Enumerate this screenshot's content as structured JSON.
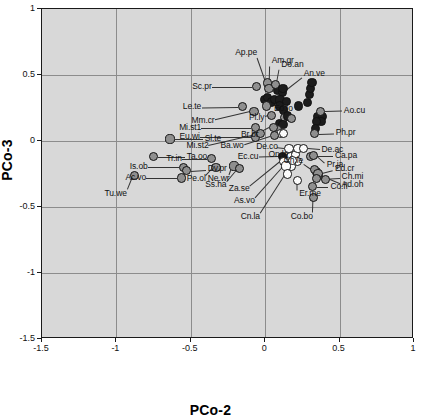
{
  "chart_data": {
    "type": "scatter",
    "title": "",
    "xlabel": "PCo-2",
    "ylabel": "PCo-3",
    "xlim": [
      -1.5,
      1.0
    ],
    "ylim": [
      -1.5,
      1.0
    ],
    "xticks": [
      "-1.5",
      "-1",
      "-0.5",
      "0",
      "0.5",
      "1"
    ],
    "xtick_values": [
      -1.5,
      -1,
      -0.5,
      0,
      0.5,
      1
    ],
    "yticks": [
      "1",
      "0.5",
      "0",
      "-0.5",
      "-1",
      "-1.5"
    ],
    "ytick_values": [
      1,
      0.5,
      0,
      -0.5,
      -1,
      -1.5
    ],
    "grid": true,
    "legend": "none",
    "plot_background": "#d8d8d8",
    "marker_groups": [
      {
        "name": "dark",
        "color": "#1c1c1c"
      },
      {
        "name": "gray",
        "color": "#8f8f8f"
      },
      {
        "name": "white",
        "color": "#fbfbfb"
      }
    ],
    "points": [
      {
        "label": "Sl.te",
        "x": -0.64,
        "y": 0.015,
        "group": "gray",
        "lx": -0.42,
        "ly": 0.015
      },
      {
        "label": "Ta.oo",
        "x": -0.75,
        "y": -0.12,
        "group": "gray",
        "lx": -0.54,
        "ly": -0.12
      },
      {
        "label": "Is.ob",
        "x": -0.55,
        "y": -0.2,
        "group": "gray",
        "lx": -0.79,
        "ly": -0.2
      },
      {
        "label": "Ac.vo",
        "x": -0.56,
        "y": -0.28,
        "group": "gray",
        "lx": -0.8,
        "ly": -0.28
      },
      {
        "label": "Tu.we",
        "x": -0.88,
        "y": -0.26,
        "group": "gray",
        "lx": -0.93,
        "ly": -0.4
      },
      {
        "label": "Dv.pr",
        "x": -0.53,
        "y": -0.225,
        "group": "gray",
        "lx": -0.4,
        "ly": -0.215
      },
      {
        "label": "Tr.in",
        "x": -0.36,
        "y": -0.135,
        "group": "gray",
        "lx": -0.56,
        "ly": -0.135
      },
      {
        "label": "Pe.ol",
        "x": -0.33,
        "y": -0.2,
        "group": "gray",
        "lx": -0.4,
        "ly": -0.285
      },
      {
        "label": "Ne.wr",
        "x": -0.21,
        "y": -0.19,
        "group": "gray",
        "lx": -0.24,
        "ly": -0.285
      },
      {
        "label": "Ss.ha",
        "x": -0.17,
        "y": -0.21,
        "group": "gray",
        "lx": -0.26,
        "ly": -0.33
      },
      {
        "label": "Sc.pr",
        "x": -0.06,
        "y": 0.41,
        "group": "gray",
        "lx": -0.36,
        "ly": 0.41
      },
      {
        "label": "Le.te",
        "x": -0.155,
        "y": 0.26,
        "group": "gray",
        "lx": -0.43,
        "ly": 0.255
      },
      {
        "label": "Mm.cr",
        "x": -0.075,
        "y": 0.225,
        "group": "gray",
        "lx": -0.34,
        "ly": 0.155
      },
      {
        "label": "Mi.st1",
        "x": -0.065,
        "y": 0.1,
        "group": "gray",
        "lx": -0.43,
        "ly": 0.1
      },
      {
        "label": "Eu.wi",
        "x": -0.065,
        "y": 0.03,
        "group": "gray",
        "lx": -0.44,
        "ly": 0.03
      },
      {
        "label": "Mi.st2",
        "x": -0.03,
        "y": 0.055,
        "group": "gray",
        "lx": -0.38,
        "ly": -0.035
      },
      {
        "label": "Ap.pe",
        "x": 0.015,
        "y": 0.44,
        "group": "gray",
        "lx": -0.055,
        "ly": 0.665
      },
      {
        "label": "Am.gr",
        "x": 0.025,
        "y": 0.4,
        "group": "gray",
        "lx": 0.03,
        "ly": 0.605
      },
      {
        "label": "Do.an",
        "x": 0.07,
        "y": 0.425,
        "group": "gray",
        "lx": 0.095,
        "ly": 0.575
      },
      {
        "label": "An.ve",
        "x": 0.12,
        "y": 0.395,
        "group": "dark",
        "lx": 0.245,
        "ly": 0.505
      },
      {
        "label": "Eo.lo",
        "x": 0.01,
        "y": 0.265,
        "group": "gray",
        "lx": 0.045,
        "ly": 0.245
      },
      {
        "label": "Pl.ly",
        "x": 0.045,
        "y": 0.195,
        "group": "gray",
        "lx": -0.005,
        "ly": 0.175
      },
      {
        "label": "Br.br",
        "x": 0.055,
        "y": 0.105,
        "group": "gray",
        "lx": -0.045,
        "ly": 0.045
      },
      {
        "label": "Ba.wo",
        "x": 0.06,
        "y": 0.04,
        "group": "gray",
        "lx": -0.145,
        "ly": -0.035
      },
      {
        "label": "Ec.cu",
        "x": 0.115,
        "y": -0.115,
        "group": "dark",
        "lx": -0.045,
        "ly": -0.12
      },
      {
        "label": "Za.se",
        "x": 0.125,
        "y": -0.155,
        "group": "white",
        "lx": -0.105,
        "ly": -0.365
      },
      {
        "label": "As.vo",
        "x": 0.14,
        "y": -0.19,
        "group": "white",
        "lx": -0.07,
        "ly": -0.455
      },
      {
        "label": "Cn.la",
        "x": 0.15,
        "y": -0.25,
        "group": "white",
        "lx": -0.035,
        "ly": -0.575
      },
      {
        "label": "On.la",
        "x": 0.185,
        "y": -0.145,
        "group": "white",
        "lx": 0.155,
        "ly": -0.105
      },
      {
        "label": "Er.me",
        "x": 0.215,
        "y": -0.3,
        "group": "white",
        "lx": 0.215,
        "ly": -0.405
      },
      {
        "label": "De.co",
        "x": 0.16,
        "y": -0.055,
        "group": "white",
        "lx": 0.085,
        "ly": -0.045
      },
      {
        "label": "De.ac",
        "x": 0.255,
        "y": -0.055,
        "group": "white",
        "lx": 0.365,
        "ly": -0.065
      },
      {
        "label": "Ca.pa",
        "x": 0.305,
        "y": -0.115,
        "group": "gray",
        "lx": 0.455,
        "ly": -0.115
      },
      {
        "label": "Pr.ja",
        "x": 0.325,
        "y": -0.11,
        "group": "gray",
        "lx": 0.4,
        "ly": -0.185
      },
      {
        "label": "Ch.le",
        "x": 0.33,
        "y": -0.215,
        "group": "gray",
        "lx": 0.255,
        "ly": -0.155
      },
      {
        "label": "Ed.cr",
        "x": 0.355,
        "y": -0.245,
        "group": "gray",
        "lx": 0.455,
        "ly": -0.215
      },
      {
        "label": "Ch.mi",
        "x": 0.345,
        "y": -0.285,
        "group": "gray",
        "lx": 0.5,
        "ly": -0.275
      },
      {
        "label": "Ad.oh",
        "x": 0.405,
        "y": -0.29,
        "group": "gray",
        "lx": 0.5,
        "ly": -0.335
      },
      {
        "label": "Co.fl",
        "x": 0.32,
        "y": -0.345,
        "group": "gray",
        "lx": 0.425,
        "ly": -0.345
      },
      {
        "label": "Co.bo",
        "x": 0.325,
        "y": -0.425,
        "group": "gray",
        "lx": 0.32,
        "ly": -0.575
      },
      {
        "label": "Ao.cu",
        "x": 0.37,
        "y": 0.225,
        "group": "gray",
        "lx": 0.515,
        "ly": 0.23
      },
      {
        "label": "Ph.pr",
        "x": 0.33,
        "y": 0.055,
        "group": "gray",
        "lx": 0.46,
        "ly": 0.06
      }
    ],
    "unlabeled_points": [
      {
        "x": 0.085,
        "y": 0.38,
        "group": "dark"
      },
      {
        "x": 0.115,
        "y": 0.37,
        "group": "dark"
      },
      {
        "x": -0.005,
        "y": 0.315,
        "group": "dark"
      },
      {
        "x": 0.015,
        "y": 0.33,
        "group": "dark"
      },
      {
        "x": 0.045,
        "y": 0.295,
        "group": "dark"
      },
      {
        "x": 0.06,
        "y": 0.315,
        "group": "dark"
      },
      {
        "x": 0.1,
        "y": 0.31,
        "group": "dark"
      },
      {
        "x": 0.095,
        "y": 0.265,
        "group": "dark"
      },
      {
        "x": 0.145,
        "y": 0.3,
        "group": "dark"
      },
      {
        "x": 0.125,
        "y": 0.235,
        "group": "dark"
      },
      {
        "x": 0.13,
        "y": 0.175,
        "group": "gray"
      },
      {
        "x": 0.15,
        "y": 0.19,
        "group": "dark"
      },
      {
        "x": 0.175,
        "y": 0.17,
        "group": "gray"
      },
      {
        "x": 0.095,
        "y": 0.135,
        "group": "dark"
      },
      {
        "x": 0.12,
        "y": 0.125,
        "group": "dark"
      },
      {
        "x": 0.085,
        "y": 0.09,
        "group": "gray"
      },
      {
        "x": 0.105,
        "y": 0.055,
        "group": "white"
      },
      {
        "x": 0.125,
        "y": 0.055,
        "group": "white"
      },
      {
        "x": 0.225,
        "y": 0.265,
        "group": "dark"
      },
      {
        "x": 0.285,
        "y": 0.29,
        "group": "dark"
      },
      {
        "x": 0.3,
        "y": 0.355,
        "group": "dark"
      },
      {
        "x": 0.305,
        "y": 0.4,
        "group": "dark"
      },
      {
        "x": 0.315,
        "y": 0.445,
        "group": "dark"
      },
      {
        "x": 0.355,
        "y": 0.185,
        "group": "dark"
      },
      {
        "x": 0.385,
        "y": 0.185,
        "group": "dark"
      },
      {
        "x": 0.375,
        "y": 0.15,
        "group": "dark"
      },
      {
        "x": 0.345,
        "y": 0.145,
        "group": "dark"
      },
      {
        "x": 0.34,
        "y": 0.095,
        "group": "dark"
      },
      {
        "x": 0.155,
        "y": -0.145,
        "group": "white"
      },
      {
        "x": 0.17,
        "y": -0.12,
        "group": "white"
      },
      {
        "x": 0.205,
        "y": -0.105,
        "group": "white"
      },
      {
        "x": 0.215,
        "y": -0.155,
        "group": "white"
      },
      {
        "x": 0.175,
        "y": -0.195,
        "group": "white"
      },
      {
        "x": 0.22,
        "y": -0.055,
        "group": "white"
      },
      {
        "x": 0.345,
        "y": -0.235,
        "group": "gray"
      },
      {
        "x": 0.355,
        "y": -0.26,
        "group": "gray"
      }
    ]
  }
}
